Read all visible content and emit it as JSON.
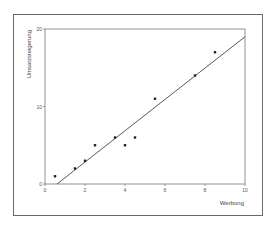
{
  "chart_data": {
    "type": "scatter",
    "title": "",
    "xlabel": "Werbung",
    "ylabel": "Umsatzsteigerung",
    "xlim": [
      0,
      10
    ],
    "ylim": [
      0,
      20
    ],
    "x_ticks": [
      "0",
      "2",
      "4",
      "6",
      "8",
      "10"
    ],
    "y_ticks": [
      "0",
      "10",
      "20"
    ],
    "grid": false,
    "legend": null,
    "series": [
      {
        "name": "Daten",
        "type": "scatter",
        "x": [
          0.5,
          1.5,
          2.0,
          2.5,
          3.5,
          4.0,
          4.5,
          5.5,
          7.5,
          8.5
        ],
        "y": [
          1,
          2,
          3,
          5,
          6,
          5,
          6,
          11,
          14,
          17
        ]
      },
      {
        "name": "Regressionsgerade",
        "type": "line",
        "x": [
          0.6,
          10
        ],
        "y": [
          0,
          19
        ]
      }
    ]
  },
  "colors": {
    "points": "#222222",
    "line": "#444444",
    "axes": "#777777",
    "frame": "#6a6a6a"
  }
}
